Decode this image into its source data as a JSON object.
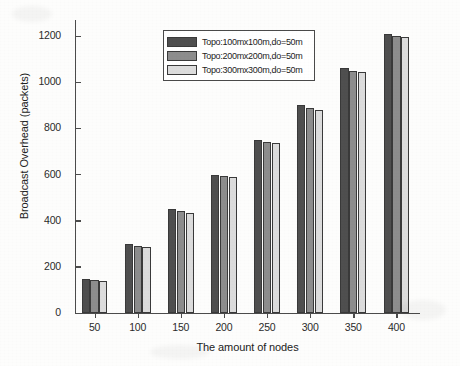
{
  "chart_data": {
    "type": "bar",
    "title": "",
    "xlabel": "The amount of nodes",
    "ylabel": "Broadcast Overhead (packets)",
    "categories": [
      "50",
      "100",
      "150",
      "200",
      "250",
      "300",
      "350",
      "400"
    ],
    "series": [
      {
        "name": "Topo:100mx100m,do=50m",
        "color": "#4f4f4f",
        "values": [
          148,
          300,
          450,
          600,
          750,
          900,
          1060,
          1210
        ]
      },
      {
        "name": "Topo:200mx200m,do=50m",
        "color": "#8d8d8d",
        "values": [
          143,
          292,
          442,
          595,
          742,
          890,
          1050,
          1200
        ]
      },
      {
        "name": "Topo:300mx300m,do=50m",
        "color": "#dcdcdc",
        "values": [
          138,
          285,
          435,
          588,
          735,
          880,
          1045,
          1195
        ]
      }
    ],
    "ylim": [
      0,
      1270
    ],
    "yticks": [
      "0",
      "200",
      "400",
      "600",
      "800",
      "1000",
      "1200"
    ],
    "ytick_values": [
      0,
      200,
      400,
      600,
      800,
      1000,
      1200
    ],
    "xticks": [
      "50",
      "100",
      "150",
      "200",
      "250",
      "300",
      "350",
      "400"
    ],
    "grid": false,
    "legend_position": "upper center"
  },
  "legend": {
    "items": [
      {
        "label": "Topo:100mx100m,do=50m",
        "color": "#4f4f4f"
      },
      {
        "label": "Topo:200mx200m,do=50m",
        "color": "#8d8d8d"
      },
      {
        "label": "Topo:300mx300m,do=50m",
        "color": "#dcdcdc"
      }
    ]
  }
}
